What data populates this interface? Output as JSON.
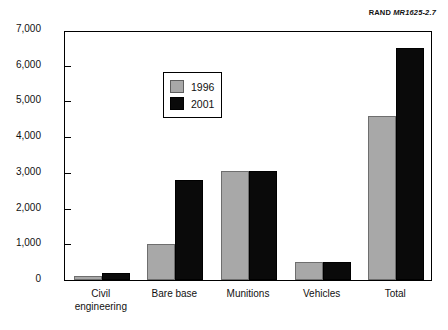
{
  "source_credit": {
    "organization": "RAND",
    "document_id": "MR1625-2.7"
  },
  "chart_data": {
    "type": "bar",
    "title": "",
    "xlabel": "",
    "ylabel": "Short tons",
    "ylim": [
      0,
      7000
    ],
    "ytick_labels": [
      "0",
      "1,000",
      "2,000",
      "3,000",
      "4,000",
      "5,000",
      "6,000",
      "7,000"
    ],
    "ytick_values": [
      0,
      1000,
      2000,
      3000,
      4000,
      5000,
      6000,
      7000
    ],
    "grid": false,
    "legend_position": "upper-left-inside",
    "categories": [
      "Civil\nengineering",
      "Bare base",
      "Munitions",
      "Vehicles",
      "Total"
    ],
    "category_labels": [
      "Civil engineering",
      "Bare base",
      "Munitions",
      "Vehicles",
      "Total"
    ],
    "series": [
      {
        "name": "1996",
        "color": "#a8a8a8",
        "values": [
          100,
          1000,
          3050,
          500,
          4600
        ]
      },
      {
        "name": "2001",
        "color": "#0a0a0a",
        "values": [
          200,
          2800,
          3050,
          500,
          6500
        ]
      }
    ]
  }
}
